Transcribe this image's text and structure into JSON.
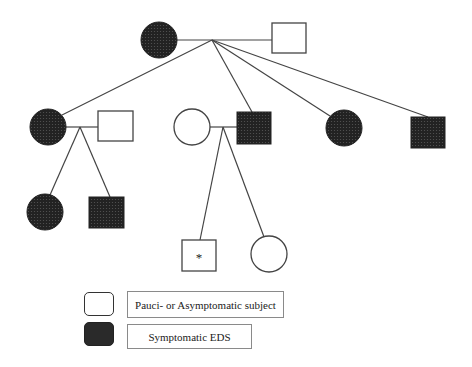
{
  "diagram": {
    "type": "pedigree",
    "title": "",
    "colors": {
      "affected_fill": "#2a2a2a",
      "unaffected_fill": "#ffffff",
      "line": "#444444"
    },
    "generations": [
      {
        "label": "I",
        "individuals": [
          {
            "id": "I-1",
            "sex": "female",
            "status": "affected"
          },
          {
            "id": "I-2",
            "sex": "male",
            "status": "unaffected"
          }
        ]
      },
      {
        "label": "II",
        "individuals": [
          {
            "id": "II-1",
            "sex": "female",
            "status": "affected",
            "parents": "I"
          },
          {
            "id": "II-1-spouse",
            "sex": "male",
            "status": "unaffected"
          },
          {
            "id": "II-2-spouse",
            "sex": "female",
            "status": "unaffected"
          },
          {
            "id": "II-2",
            "sex": "male",
            "status": "affected",
            "parents": "I"
          },
          {
            "id": "II-3",
            "sex": "female",
            "status": "affected",
            "parents": "I"
          },
          {
            "id": "II-4",
            "sex": "male",
            "status": "affected",
            "parents": "I"
          }
        ]
      },
      {
        "label": "III",
        "individuals": [
          {
            "id": "III-1",
            "sex": "female",
            "status": "affected",
            "parents": "II-1"
          },
          {
            "id": "III-2",
            "sex": "male",
            "status": "affected",
            "parents": "II-1"
          },
          {
            "id": "III-3",
            "sex": "male",
            "status": "unaffected",
            "parents": "II-2",
            "marker": "*"
          },
          {
            "id": "III-4",
            "sex": "female",
            "status": "unaffected",
            "parents": "II-2"
          }
        ]
      }
    ],
    "proband_marker": "*"
  },
  "legend": {
    "items": [
      {
        "label": "Pauci- or Asymptomatic subject",
        "fill": "#ffffff"
      },
      {
        "label": "Symptomatic EDS",
        "fill": "#2a2a2a"
      }
    ]
  }
}
